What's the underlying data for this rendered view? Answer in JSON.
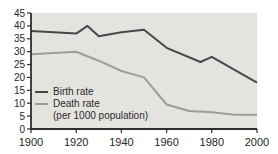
{
  "chart": {
    "background_color": "#ffffff",
    "plot_bg_color": "#e4e3e0",
    "axis_color": "#2e2e2e",
    "text_color": "#262626"
  },
  "chart_data": {
    "type": "line",
    "title": "",
    "xlabel": "",
    "ylabel": "",
    "xlim": [
      1900,
      2000
    ],
    "ylim": [
      0,
      45
    ],
    "x_ticks": [
      1900,
      1920,
      1940,
      1960,
      1980,
      2000
    ],
    "y_ticks": [
      0,
      5,
      10,
      15,
      20,
      25,
      30,
      35,
      40,
      45
    ],
    "grid": false,
    "legend_position": "inside-left",
    "unit_note": "(per 1000 population)",
    "series": [
      {
        "name": "Birth rate",
        "color": "#48484a",
        "points": [
          [
            1900,
            38
          ],
          [
            1910,
            37.5
          ],
          [
            1920,
            37
          ],
          [
            1925,
            40
          ],
          [
            1930,
            36
          ],
          [
            1940,
            37.5
          ],
          [
            1950,
            38.5
          ],
          [
            1960,
            31.5
          ],
          [
            1975,
            26
          ],
          [
            1980,
            28
          ],
          [
            2000,
            18
          ]
        ]
      },
      {
        "name": "Death rate",
        "color": "#9c9c9a",
        "points": [
          [
            1900,
            29
          ],
          [
            1910,
            29.5
          ],
          [
            1920,
            30
          ],
          [
            1930,
            26.5
          ],
          [
            1940,
            22.5
          ],
          [
            1950,
            20
          ],
          [
            1960,
            9.5
          ],
          [
            1970,
            7
          ],
          [
            1980,
            6.5
          ],
          [
            1990,
            5.5
          ],
          [
            2000,
            5.5
          ]
        ]
      }
    ]
  }
}
